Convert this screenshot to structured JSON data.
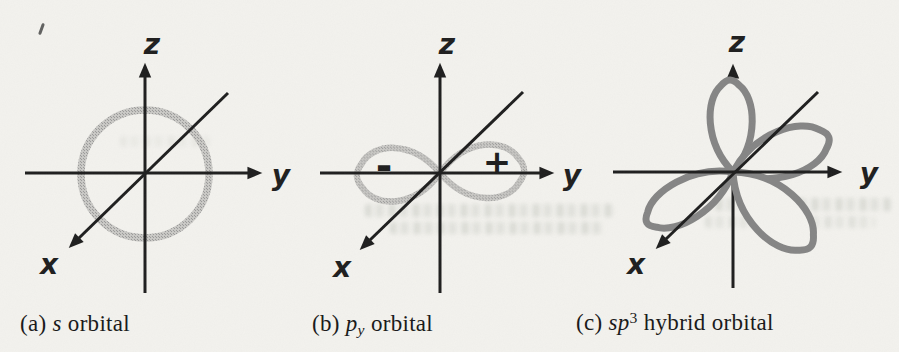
{
  "figure": {
    "colors": {
      "background": "#f3f2ee",
      "axis": "#1e1e1e",
      "stipple_lobe": "#9b9b9b",
      "solid_lobe": "#858585"
    },
    "panels": [
      {
        "key": "a",
        "orbital": "s",
        "axes": {
          "x": "x",
          "y": "y",
          "z": "z"
        },
        "caption": {
          "index": "(a)",
          "math": "s",
          "rest": "orbital"
        }
      },
      {
        "key": "b",
        "orbital": "py",
        "axes": {
          "x": "x",
          "y": "y",
          "z": "z"
        },
        "signs": {
          "negative": "-",
          "positive": "+"
        },
        "caption": {
          "index": "(b)",
          "math": "p",
          "sub": "y",
          "rest": "orbital"
        }
      },
      {
        "key": "c",
        "orbital": "sp3 hybrid",
        "axes": {
          "x": "x",
          "y": "y",
          "z": "z"
        },
        "caption": {
          "index": "(c)",
          "math": "sp",
          "sup": "3",
          "rest": "hybrid orbital"
        }
      }
    ]
  }
}
